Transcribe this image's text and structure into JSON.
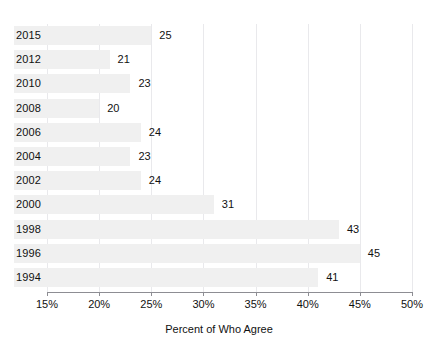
{
  "chart_data": {
    "type": "bar",
    "orientation": "horizontal",
    "title": "",
    "subtitle": "",
    "xlabel": "Percent of Who Agree",
    "ylabel": "",
    "categories": [
      "2015",
      "2012",
      "2010",
      "2008",
      "2006",
      "2004",
      "2002",
      "2000",
      "1998",
      "1996",
      "1994"
    ],
    "values": [
      25,
      21,
      23,
      20,
      24,
      23,
      24,
      31,
      43,
      45,
      41
    ],
    "value_labels": [
      "25",
      "21",
      "23",
      "20",
      "24",
      "23",
      "24",
      "31",
      "43",
      "45",
      "41"
    ],
    "xlim": [
      15,
      50
    ],
    "xticks": [
      15,
      20,
      25,
      30,
      35,
      40,
      45,
      50
    ],
    "xtick_labels": [
      "15%",
      "20%",
      "25%",
      "30%",
      "35%",
      "40%",
      "45%",
      "50%"
    ],
    "grid": true,
    "grid_axis": "x",
    "legend": false,
    "legend_position": "none",
    "bar_color": "#f0f0f0",
    "axis_color": "#8d8d93",
    "grid_color": "#e9e9ec",
    "text_color": "#111111",
    "background": "#ffffff"
  }
}
